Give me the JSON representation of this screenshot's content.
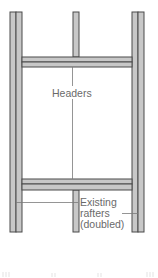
{
  "diagram": {
    "title": "",
    "labels": {
      "headers": "Headers",
      "existing_rafters_line1": "Existing",
      "existing_rafters_line2": "rafters",
      "existing_rafters_line3": "(doubled)"
    },
    "members": [
      {
        "id": "left-doubled-rafter",
        "type": "rafter",
        "doubled": true
      },
      {
        "id": "right-doubled-rafter",
        "type": "rafter",
        "doubled": true
      },
      {
        "id": "center-rafter-top",
        "type": "rafter",
        "doubled": false
      },
      {
        "id": "center-rafter-bottom",
        "type": "rafter",
        "doubled": false
      },
      {
        "id": "top-header",
        "type": "header",
        "doubled": true
      },
      {
        "id": "bottom-header",
        "type": "header",
        "doubled": true
      }
    ],
    "colors": {
      "wood_fill": "#c8c8c8",
      "wood_edge": "#4a4a4a",
      "leader_line": "#7a7a7a",
      "label_text": "#6a6a6a",
      "background": "#ffffff"
    }
  }
}
